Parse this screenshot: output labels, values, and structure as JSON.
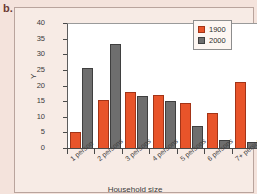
{
  "figure": {
    "letter": "b."
  },
  "chart_data": {
    "type": "bar",
    "title": "",
    "xlabel": "Household size",
    "ylabel": "Y",
    "ylim": [
      0,
      40
    ],
    "yticks": [
      0,
      5,
      10,
      15,
      20,
      25,
      30,
      35,
      40
    ],
    "grid": false,
    "legend_position": "top-right",
    "categories": [
      "1 person",
      "2 persons",
      "3 persons",
      "4 persons",
      "5 persons",
      "6 persons",
      "7+ persons"
    ],
    "series": [
      {
        "name": "1900",
        "color": "#e8542a",
        "values": [
          5,
          15.3,
          17.8,
          17,
          14.4,
          11.3,
          21
        ]
      },
      {
        "name": "2000",
        "color": "#6e6e6e",
        "values": [
          25.5,
          33.2,
          16.6,
          15,
          7.1,
          2.7,
          1.8
        ]
      }
    ]
  }
}
